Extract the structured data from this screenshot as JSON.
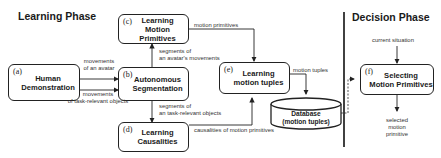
{
  "phases": {
    "learning": "Learning Phase",
    "decision": "Decision Phase"
  },
  "boxes": {
    "a": {
      "tag": "(a)",
      "line1": "Human",
      "line2": "Demonstration"
    },
    "b": {
      "tag": "(b)",
      "line1": "Autonomous",
      "line2": "Segmentation"
    },
    "c": {
      "tag": "(c)",
      "line1": "Learning",
      "line2": "Motion Primitives"
    },
    "d": {
      "tag": "(d)",
      "line1": "Learning",
      "line2": "Causalities"
    },
    "e": {
      "tag": "(e)",
      "line1": "Learning",
      "line2": "motion tuples"
    },
    "f": {
      "tag": "(f)",
      "line1": "Selecting",
      "line2": "Motion Primitives"
    }
  },
  "database": {
    "line1": "Database",
    "line2": "(motion tuples)"
  },
  "edge_labels": {
    "avatar_movements": [
      "movements",
      "of an avatar"
    ],
    "object_movements": [
      "movements",
      "of task-relevant objects"
    ],
    "avatar_segments": [
      "segments of",
      "an avatar's movements"
    ],
    "object_segments": [
      "segments of",
      "an task-relevant objects"
    ],
    "motion_primitives": "motion primitives",
    "motion_tuples": "motion tuples",
    "causalities": "causalities of motion primitives",
    "current_situation": "current situation",
    "selected": [
      "selected",
      "motion",
      "primitive"
    ]
  }
}
